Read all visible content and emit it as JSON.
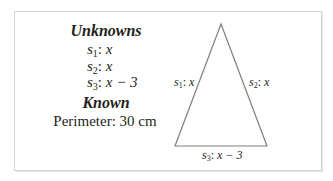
{
  "unknowns": {
    "heading": "Unknowns",
    "items": [
      {
        "var": "s",
        "sub": "1",
        "sep": ": ",
        "expr": "x"
      },
      {
        "var": "s",
        "sub": "2",
        "sep": ": ",
        "expr": "x"
      },
      {
        "var": "s",
        "sub": "3",
        "sep": ": ",
        "expr": "x − 3"
      }
    ]
  },
  "known": {
    "heading": "Known",
    "value": "Perimeter: 30 cm"
  },
  "triangle": {
    "stroke_color": "#808080",
    "vertices": {
      "apex": [
        221,
        24
      ],
      "bottom_left": [
        175,
        146
      ],
      "bottom_right": [
        267,
        146
      ]
    },
    "labels": {
      "left": {
        "var": "s",
        "sub": "1",
        "sep": ": ",
        "expr": "x"
      },
      "right": {
        "var": "s",
        "sub": "2",
        "sep": ": ",
        "expr": "x"
      },
      "bottom": {
        "var": "s",
        "sub": "3",
        "sep": ": ",
        "expr": "x − 3"
      }
    }
  }
}
